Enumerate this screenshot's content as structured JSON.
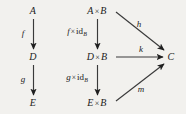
{
  "figure": {
    "type": "commutative-diagram",
    "background_color": "#f2f1ee",
    "ink_color": "#1c1c1c",
    "width": 186,
    "height": 114
  },
  "left_diagram": {
    "objects": [
      {
        "key": "A",
        "label": "A",
        "x": 33,
        "y": 11
      },
      {
        "key": "D",
        "label": "D",
        "x": 33,
        "y": 57
      },
      {
        "key": "E",
        "label": "E",
        "x": 33,
        "y": 103
      }
    ],
    "arrows": [
      {
        "key": "f",
        "label": "f",
        "from": "A",
        "to": "D",
        "label_x": 23,
        "label_y": 33
      },
      {
        "key": "g",
        "label": "g",
        "from": "D",
        "to": "E",
        "label_x": 23,
        "label_y": 79
      }
    ]
  },
  "right_diagram": {
    "objects": [
      {
        "key": "AxB",
        "lhs": "A",
        "times": "×",
        "rhs": "B",
        "x": 97,
        "y": 11
      },
      {
        "key": "DxB",
        "lhs": "D",
        "times": "×",
        "rhs": "B",
        "x": 97,
        "y": 57
      },
      {
        "key": "ExB",
        "lhs": "E",
        "times": "×",
        "rhs": "B",
        "x": 97,
        "y": 103
      },
      {
        "key": "C",
        "lhs": "C",
        "times": "",
        "rhs": "",
        "x": 171,
        "y": 57
      }
    ],
    "vertical_arrows": [
      {
        "key": "f-times-id",
        "fn": "f",
        "times": "×",
        "id": "id",
        "sub": "B",
        "from": "AxB",
        "to": "DxB",
        "label_x": 77,
        "label_y": 32
      },
      {
        "key": "g-times-id",
        "fn": "g",
        "times": "×",
        "id": "id",
        "sub": "B",
        "from": "DxB",
        "to": "ExB",
        "label_x": 77,
        "label_y": 78
      }
    ],
    "target_arrows": [
      {
        "key": "h",
        "label": "h",
        "from": "AxB",
        "to": "C",
        "label_x": 139,
        "label_y": 24
      },
      {
        "key": "k",
        "label": "k",
        "from": "DxB",
        "to": "C",
        "label_x": 141,
        "label_y": 49
      },
      {
        "key": "m",
        "label": "m",
        "from": "ExB",
        "to": "C",
        "label_x": 141,
        "label_y": 89
      }
    ]
  }
}
